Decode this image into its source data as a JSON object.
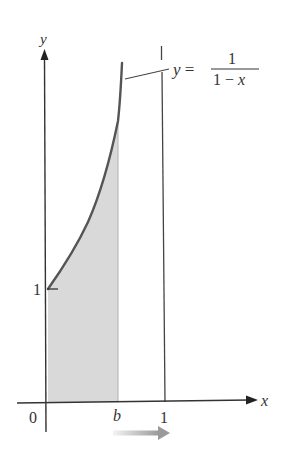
{
  "figure": {
    "type": "diagram",
    "axes": {
      "x_label": "x",
      "y_label": "y",
      "origin_label": "0",
      "x_tick_labels": [
        "b",
        "1"
      ],
      "y_tick_labels": [
        "1"
      ]
    },
    "curve": {
      "label_lhs": "y =",
      "label_numerator": "1",
      "label_denominator": "1 − x",
      "equation": "y = 1/(1 − x)"
    },
    "asymptote": {
      "x": 1
    },
    "shaded_region": {
      "from": 0,
      "to": "b",
      "color": "#d9d9d9"
    },
    "motion_arrow": {
      "direction": "right",
      "meaning": "b approaches 1"
    },
    "colors": {
      "axis": "#333333",
      "curve": "#555555",
      "shade": "#d9d9d9",
      "arrow_start": "#f2f2f2",
      "arrow_end": "#999999"
    }
  }
}
